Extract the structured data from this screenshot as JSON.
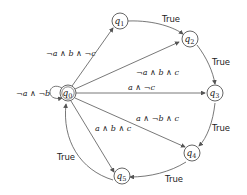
{
  "diagram": {
    "type": "state-machine",
    "nodes": [
      {
        "id": "q0",
        "label": "q0",
        "sub": "0",
        "initial": true
      },
      {
        "id": "q1",
        "label": "q1",
        "sub": "1"
      },
      {
        "id": "q2",
        "label": "q2",
        "sub": "2"
      },
      {
        "id": "q3",
        "label": "q3",
        "sub": "3"
      },
      {
        "id": "q4",
        "label": "q4",
        "sub": "4"
      },
      {
        "id": "q5",
        "label": "q5",
        "sub": "5"
      }
    ],
    "edges": [
      {
        "from": "q0",
        "to": "q0",
        "label": "¬a ∧ ¬b"
      },
      {
        "from": "q0",
        "to": "q1",
        "label": "¬a ∧ b ∧ ¬c"
      },
      {
        "from": "q0",
        "to": "q2",
        "label": "¬a ∧ b ∧ c"
      },
      {
        "from": "q0",
        "to": "q3",
        "label": "a ∧ ¬c"
      },
      {
        "from": "q0",
        "to": "q4",
        "label": "a ∧ ¬b ∧ c"
      },
      {
        "from": "q0",
        "to": "q5",
        "label": "a ∧ b ∧ c"
      },
      {
        "from": "q1",
        "to": "q2",
        "label": "True"
      },
      {
        "from": "q2",
        "to": "q3",
        "label": "True"
      },
      {
        "from": "q3",
        "to": "q4",
        "label": "True"
      },
      {
        "from": "q4",
        "to": "q5",
        "label": "True"
      },
      {
        "from": "q5",
        "to": "q0",
        "label": "True"
      }
    ]
  }
}
